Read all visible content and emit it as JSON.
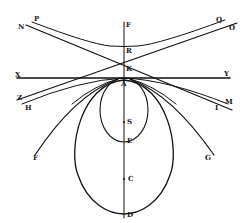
{
  "diagram": {
    "style": "engraved geometric figure, black ink on white",
    "ink_color": "#111111",
    "background": "#ffffff",
    "labels": {
      "P": "P",
      "N": "N",
      "Q": "Q",
      "O": "O",
      "F_top": "F",
      "R": "R",
      "K": "K",
      "X": "X",
      "Y": "Y",
      "A": "A",
      "Z": "Z",
      "H": "H",
      "M": "M",
      "I": "I",
      "S": "S",
      "E": "E",
      "C": "C",
      "D": "D",
      "F_bottom": "F",
      "G": "G"
    }
  }
}
